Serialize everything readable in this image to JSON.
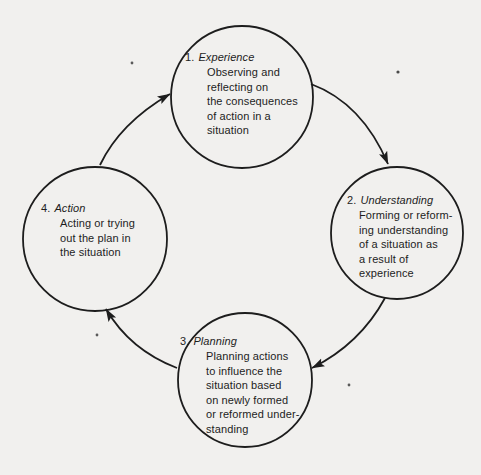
{
  "colors": {
    "background": "#f1f0ee",
    "ink": "#1d1d1d"
  },
  "diagram": {
    "type": "cycle",
    "nodes": [
      {
        "number": "1.",
        "name": "Experience",
        "lines": [
          "Observing and",
          "reflecting on",
          "the consequences",
          "of action in a",
          "situation"
        ]
      },
      {
        "number": "2.",
        "name": "Understanding",
        "lines": [
          "Forming or reform-",
          "ing understanding",
          "of a situation as",
          "a result of",
          "experience"
        ]
      },
      {
        "number": "3.",
        "name": "Planning",
        "lines": [
          "Planning actions",
          "to influence the",
          "situation based",
          "on newly formed",
          "or reformed under-",
          "standing"
        ]
      },
      {
        "number": "4.",
        "name": "Action",
        "lines": [
          "Acting or trying",
          "out the plan in",
          "the situation"
        ]
      }
    ],
    "edges": [
      {
        "from": "Experience",
        "to": "Understanding"
      },
      {
        "from": "Understanding",
        "to": "Planning"
      },
      {
        "from": "Planning",
        "to": "Action"
      },
      {
        "from": "Action",
        "to": "Experience"
      }
    ]
  }
}
